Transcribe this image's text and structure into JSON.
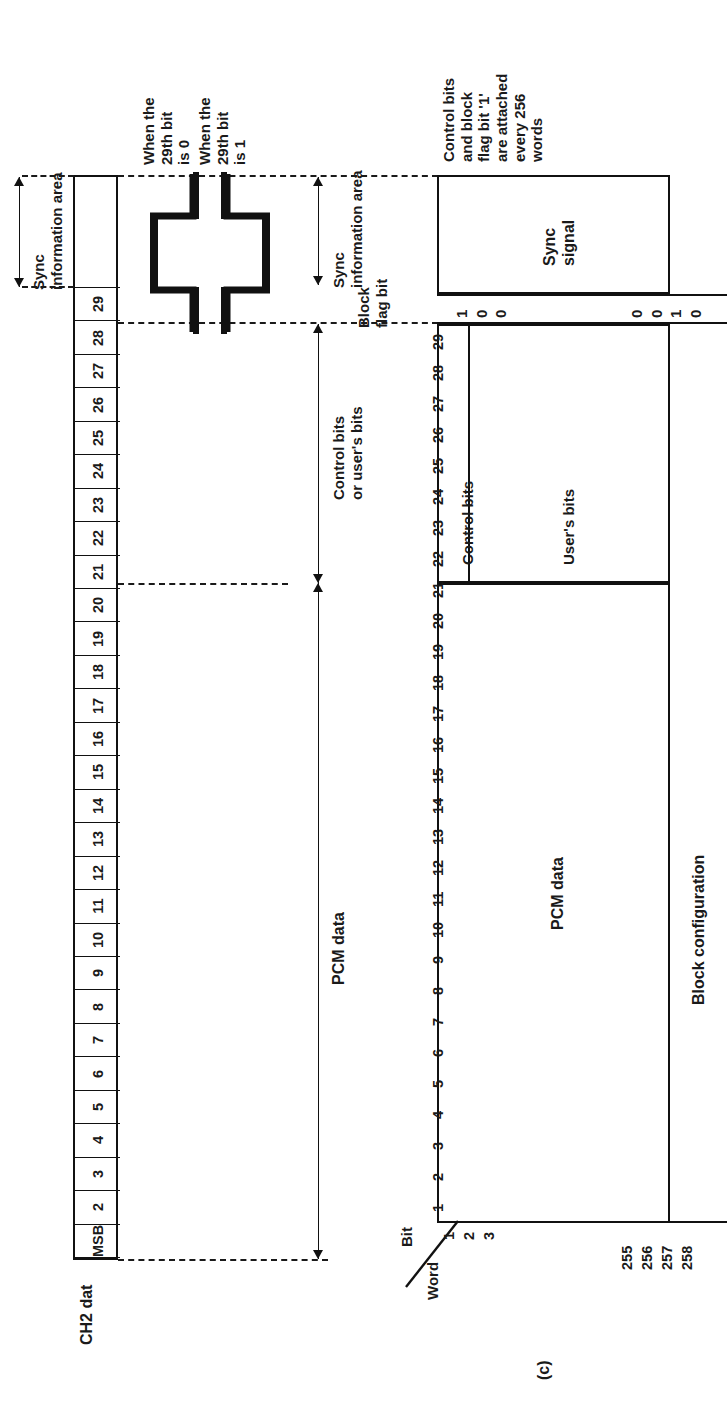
{
  "figure": {
    "caption": "(c)",
    "left_panel_title": "CH2 dat",
    "right_panel_title": "Block configuration"
  },
  "left_panel": {
    "sync_bracket_label": "Sync\ninformation area",
    "cells": [
      {
        "label": "MSB"
      },
      {
        "label": "2"
      },
      {
        "label": "3"
      },
      {
        "label": "4"
      },
      {
        "label": "5"
      },
      {
        "label": "6"
      },
      {
        "label": "7"
      },
      {
        "label": "8"
      },
      {
        "label": "9"
      },
      {
        "label": "10"
      },
      {
        "label": "11"
      },
      {
        "label": "12"
      },
      {
        "label": "13"
      },
      {
        "label": "14"
      },
      {
        "label": "15"
      },
      {
        "label": "16"
      },
      {
        "label": "17"
      },
      {
        "label": "18"
      },
      {
        "label": "19"
      },
      {
        "label": "20"
      },
      {
        "label": "21"
      },
      {
        "label": "22"
      },
      {
        "label": "23"
      },
      {
        "label": "24"
      },
      {
        "label": "25"
      },
      {
        "label": "26"
      },
      {
        "label": "27"
      },
      {
        "label": "28"
      },
      {
        "label": "29"
      },
      {
        "label": ""
      },
      {
        "label": ""
      }
    ]
  },
  "waveform": {
    "label_zero": "When the\n29th bit\nis 0",
    "label_one": "When the\n29th bit\nis 1"
  },
  "dimensions": {
    "sync_information_area": "Sync\ninformation area",
    "control_or_user_bits": "Control bits\nor user's bits",
    "pcm_data": "PCM data",
    "block_flag_bit": "Block\nflag bit"
  },
  "right_panel": {
    "note": "Control bits\nand block\nflag bit '1'\nare attached\nevery 256\nwords",
    "sync_signal_label": "Sync\nsignal",
    "control_bits_label": "Control bits",
    "users_bits_label": "User's bits",
    "pcm_data_label": "PCM data",
    "block_configuration_label": "Block configuration",
    "axis_bit_label": "Bit",
    "axis_word_label": "Word",
    "bit_numbers": [
      "1",
      "2",
      "3",
      "4",
      "5",
      "6",
      "7",
      "8",
      "9",
      "10",
      "11",
      "12",
      "13",
      "14",
      "15",
      "16",
      "17",
      "18",
      "19",
      "20",
      "21",
      "22",
      "23",
      "24",
      "25",
      "26",
      "27",
      "28",
      "29"
    ],
    "word_numbers_start": [
      "1",
      "2",
      "3"
    ],
    "word_numbers_end": [
      "255",
      "256",
      "257",
      "258"
    ],
    "flag_bit_values_left": [
      "1",
      "0",
      "0"
    ],
    "flag_bit_values_right": [
      "0",
      "0",
      "1",
      "0"
    ]
  },
  "colors": {
    "ink": "#1a1a1a",
    "paper": "#ffffff"
  }
}
